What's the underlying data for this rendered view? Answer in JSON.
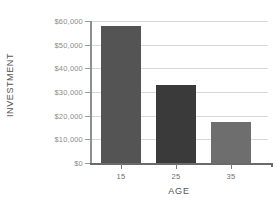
{
  "chart_data": {
    "type": "bar",
    "title": "",
    "categories": [
      "15",
      "25",
      "35"
    ],
    "values": [
      58000,
      33000,
      17500
    ],
    "xlabel": "AGE",
    "ylabel": "INVESTMENT",
    "ylim": [
      0,
      60000
    ],
    "ytick_values": [
      0,
      10000,
      20000,
      30000,
      40000,
      50000,
      60000
    ],
    "ytick_labels": [
      "$0",
      "$10,000",
      "$20,000",
      "$30,000",
      "$40,000",
      "$50,000",
      "$60,000"
    ],
    "grid": true,
    "legend": false,
    "bar_colors": [
      "#545454",
      "#3a3a3a",
      "#6e6e6e"
    ],
    "axis_color": "#8f8f8f",
    "grid_color": "#d8d8d8",
    "label_color": "#8a8a8a",
    "title_color": "#555555"
  }
}
